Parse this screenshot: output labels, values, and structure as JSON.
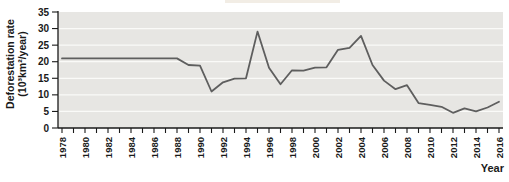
{
  "decor": {
    "cropped_highlight_color": "#f2ede5"
  },
  "chart_data": {
    "type": "line",
    "title": "",
    "xlabel": "Year",
    "ylabel_line1": "Deforestation rate",
    "ylabel_line2": "(10³km²/year)",
    "x": [
      1978,
      1979,
      1980,
      1981,
      1982,
      1983,
      1984,
      1985,
      1986,
      1987,
      1988,
      1989,
      1990,
      1991,
      1992,
      1993,
      1994,
      1995,
      1996,
      1997,
      1998,
      1999,
      2000,
      2001,
      2002,
      2003,
      2004,
      2005,
      2006,
      2007,
      2008,
      2009,
      2010,
      2011,
      2012,
      2013,
      2014,
      2015,
      2016
    ],
    "values": [
      21,
      21,
      21,
      21,
      21,
      21,
      21,
      21,
      21,
      21,
      21,
      19,
      18.8,
      11,
      13.8,
      14.9,
      15,
      29.1,
      18.2,
      13.2,
      17.4,
      17.3,
      18.2,
      18.3,
      23.6,
      24.2,
      27.8,
      19,
      14.3,
      11.7,
      12.9,
      7.5,
      7,
      6.4,
      4.6,
      5.9,
      5,
      6.2,
      7.9
    ],
    "xlim": [
      1978,
      2016
    ],
    "ylim": [
      0,
      35
    ],
    "ytick_step": 5,
    "xtick_label_step": 2,
    "grid": "horizontal",
    "legend": "none",
    "colors": {
      "panel": "#e7e6e3",
      "gridline": "#fafaf8",
      "line": "#5e5e5e",
      "axis": "#1a1a1a",
      "text": "#1a1a1a"
    }
  }
}
